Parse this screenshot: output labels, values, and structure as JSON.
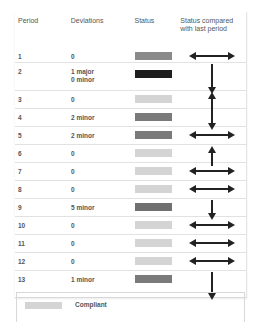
{
  "table": {
    "headers": {
      "period": "Period",
      "deviations": "Deviations",
      "status": "Status",
      "comparison": "Status compared with last period"
    },
    "rows": [
      {
        "period": "1",
        "deviations": "0",
        "status_color": "#8a8a8a",
        "trend": "same"
      },
      {
        "period": "2",
        "deviations": "1 major\n0 minor",
        "deviations_line1": "1 major",
        "deviations_line2": "0 minor",
        "status_color": "#1e1e1e",
        "trend": "down"
      },
      {
        "period": "3",
        "deviations": "0",
        "status_color": "#d4d4d4",
        "trend": "up"
      },
      {
        "period": "4",
        "deviations": "2 minor",
        "status_color": "#7a7a7a",
        "trend": "down"
      },
      {
        "period": "5",
        "deviations": "2 minor",
        "status_color": "#7a7a7a",
        "trend": "same"
      },
      {
        "period": "6",
        "deviations": "0",
        "status_color": "#d4d4d4",
        "trend": "up"
      },
      {
        "period": "7",
        "deviations": "0",
        "status_color": "#d4d4d4",
        "trend": "same"
      },
      {
        "period": "8",
        "deviations": "0",
        "status_color": "#d4d4d4",
        "trend": "same"
      },
      {
        "period": "9",
        "deviations": "5 minor",
        "status_color": "#707070",
        "trend": "down"
      },
      {
        "period": "10",
        "deviations": "0",
        "status_color": "#d4d4d4",
        "trend": "same"
      },
      {
        "period": "11",
        "deviations": "0",
        "status_color": "#d4d4d4",
        "trend": "same"
      },
      {
        "period": "12",
        "deviations": "0",
        "status_color": "#d4d4d4",
        "trend": "same"
      },
      {
        "period": "13",
        "deviations": "1 minor",
        "status_color": "#7a7a7a",
        "trend": "down"
      }
    ]
  },
  "legend": {
    "items": [
      {
        "label": "Compliant",
        "color": "#d4d4d4"
      }
    ]
  },
  "icons": {
    "same": "double-horizontal-arrow",
    "up": "up-arrow",
    "down": "down-arrow"
  }
}
